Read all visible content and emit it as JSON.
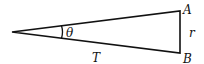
{
  "diagram": {
    "type": "right-triangle",
    "vertices": {
      "apex": {
        "x": 12,
        "y": 32
      },
      "A": {
        "x": 180,
        "y": 11
      },
      "B": {
        "x": 180,
        "y": 53
      }
    },
    "labels": {
      "A": "A",
      "B": "B",
      "r": "r",
      "theta": "θ",
      "T": "T"
    },
    "stroke_color": "#111111"
  }
}
